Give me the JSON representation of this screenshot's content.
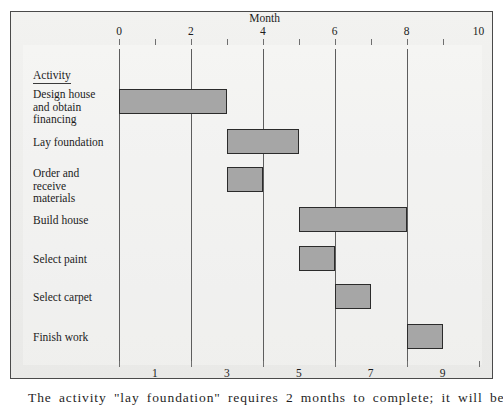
{
  "figure": {
    "axis_title_top": "Month",
    "axis_title_bottom": "Month",
    "activity_header": "Activity",
    "caption": "The activity \"lay foundation\" requires 2 months to complete; it will be finished at"
  },
  "colors": {
    "bar_fill": "#a6a6a6",
    "bar_border": "#2b2b2b",
    "gridline": "#5d5d5d",
    "panel_background": "#eeeeec",
    "frame_border": "#4a4a4a",
    "text": "#1c1c1c"
  },
  "chart_data": {
    "type": "bar",
    "subtype": "gantt",
    "title": "",
    "xlabel": "Month",
    "ylabel": "Activity",
    "xlim": [
      0,
      10
    ],
    "grid": true,
    "legend": "none",
    "top_axis_ticks": [
      {
        "label": "0",
        "value": 0,
        "gridline": true
      },
      {
        "label": "",
        "value": 1,
        "gridline": false
      },
      {
        "label": "2",
        "value": 2,
        "gridline": true
      },
      {
        "label": "",
        "value": 3,
        "gridline": false
      },
      {
        "label": "4",
        "value": 4,
        "gridline": true
      },
      {
        "label": "",
        "value": 5,
        "gridline": false
      },
      {
        "label": "6",
        "value": 6,
        "gridline": true
      },
      {
        "label": "",
        "value": 7,
        "gridline": false
      },
      {
        "label": "8",
        "value": 8,
        "gridline": true
      },
      {
        "label": "",
        "value": 9,
        "gridline": false
      },
      {
        "label": "10",
        "value": 10,
        "gridline": false
      }
    ],
    "bottom_axis_ticks": [
      {
        "label": "1",
        "value": 1
      },
      {
        "label": "3",
        "value": 3
      },
      {
        "label": "5",
        "value": 5
      },
      {
        "label": "7",
        "value": 7
      },
      {
        "label": "9",
        "value": 9
      }
    ],
    "categories": [
      "Design house and obtain financing",
      "Lay foundation",
      "Order and receive materials",
      "Build house",
      "Select paint",
      "Select carpet",
      "Finish work"
    ],
    "tasks": [
      {
        "name": "Design house and obtain financing",
        "label_lines": [
          "Design house",
          "and obtain",
          "financing"
        ],
        "start": 0,
        "end": 3,
        "duration": 3
      },
      {
        "name": "Lay foundation",
        "label_lines": [
          "Lay foundation"
        ],
        "start": 3,
        "end": 5,
        "duration": 2
      },
      {
        "name": "Order and receive materials",
        "label_lines": [
          "Order and",
          "receive",
          "materials"
        ],
        "start": 3,
        "end": 4,
        "duration": 1
      },
      {
        "name": "Build house",
        "label_lines": [
          "Build house"
        ],
        "start": 5,
        "end": 8,
        "duration": 3
      },
      {
        "name": "Select paint",
        "label_lines": [
          "Select paint"
        ],
        "start": 5,
        "end": 6,
        "duration": 1
      },
      {
        "name": "Select carpet",
        "label_lines": [
          "Select carpet"
        ],
        "start": 6,
        "end": 7,
        "duration": 1
      },
      {
        "name": "Finish work",
        "label_lines": [
          "Finish work"
        ],
        "start": 8,
        "end": 9,
        "duration": 1
      }
    ]
  }
}
